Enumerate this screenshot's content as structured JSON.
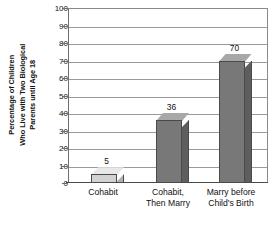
{
  "chart_data": {
    "type": "bar",
    "title": "",
    "subtitle": "",
    "xlabel": "",
    "ylabel": "Percentage of Children Who Live with Two Biological Parents until Age 18",
    "ylabel_lines": [
      "Percentage of Children",
      "Who Live with Two Biological",
      "Parents until Age 18"
    ],
    "categories": [
      "Cohabit",
      "Cohabit, Then Marry",
      "Marry before Child's Birth"
    ],
    "category_lines": [
      [
        "Cohabit"
      ],
      [
        "Cohabit,",
        "Then Marry"
      ],
      [
        "Marry before",
        "Child's Birth"
      ]
    ],
    "values": [
      5,
      36,
      70
    ],
    "value_labels": [
      "5",
      "36",
      "70"
    ],
    "ylim": [
      0,
      100
    ],
    "ytick_step": 10,
    "yticks": [
      100,
      90,
      80,
      70,
      60,
      50,
      40,
      30,
      20,
      10,
      0
    ],
    "ytick_labels": [
      "100",
      "90",
      "80",
      "70",
      "60",
      "50",
      "40",
      "30",
      "20",
      "10",
      "0"
    ],
    "grid": true,
    "grid_axis": "y",
    "legend": false,
    "legend_position": "none",
    "bar_colors": [
      "#d2d2d2",
      "#787878",
      "#787878"
    ],
    "bar_top_colors": [
      "#e8e8e8",
      "#a8a8a8",
      "#a8a8a8"
    ],
    "bar_side_colors": [
      "#b0b0b0",
      "#5e5e5e",
      "#5e5e5e"
    ],
    "outline_color": "#4a4a4a",
    "grid_color": "#9a9a9a",
    "axis_color": "#4a4a4a",
    "background": "#ffffff"
  }
}
